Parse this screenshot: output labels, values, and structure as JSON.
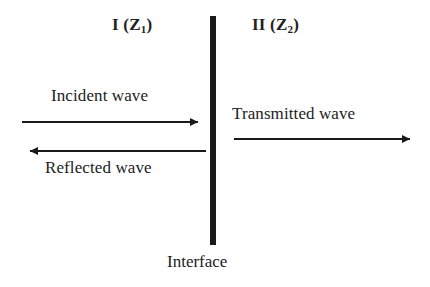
{
  "diagram": {
    "background_color": "#ffffff",
    "stroke_color": "#1a1a1a",
    "regions": [
      {
        "id": "region-1",
        "roman": "I",
        "impedance_symbol": "Z",
        "impedance_index": "1",
        "text": "I (Z1)"
      },
      {
        "id": "region-2",
        "roman": "II",
        "impedance_symbol": "Z",
        "impedance_index": "2",
        "text": "II (Z2)"
      }
    ],
    "interface": {
      "label": "Interface",
      "x": 213,
      "y_top": 16,
      "y_bottom": 245,
      "thickness": 6
    },
    "waves": [
      {
        "id": "incident",
        "label": "Incident wave",
        "direction": "right",
        "x_start": 22,
        "x_end": 206,
        "y": 122,
        "label_x": 51,
        "label_y": 87
      },
      {
        "id": "reflected",
        "label": "Reflected wave",
        "direction": "left",
        "x_start": 206,
        "x_end": 22,
        "y": 151,
        "label_x": 45,
        "label_y": 159
      },
      {
        "id": "transmitted",
        "label": "Transmitted wave",
        "direction": "right",
        "x_start": 234,
        "x_end": 418,
        "y": 139,
        "label_x": 232,
        "label_y": 105
      }
    ]
  }
}
